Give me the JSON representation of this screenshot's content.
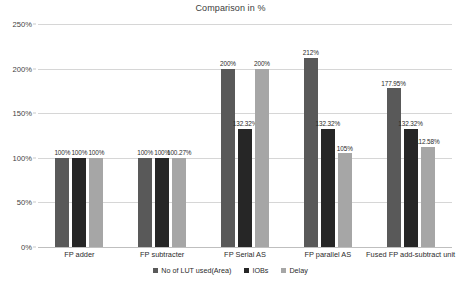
{
  "chart_data": {
    "type": "bar",
    "title": "Comparison in %",
    "xlabel": "",
    "ylabel": "",
    "ylim": [
      0,
      250
    ],
    "ytick_labels": [
      "0%",
      "50%",
      "100%",
      "150%",
      "200%",
      "250%"
    ],
    "ytick_values": [
      0,
      50,
      100,
      150,
      200,
      250
    ],
    "grid": true,
    "legend_position": "bottom",
    "categories": [
      "FP adder",
      "FP subtracter",
      "FP  Serial AS",
      "FP parallel AS",
      "Fused FP add-subtract unit"
    ],
    "series": [
      {
        "name": "No of LUT used(Area)",
        "color": "#595959",
        "values": [
          100,
          100,
          200,
          212,
          177.95
        ],
        "labels": [
          "100%",
          "100%",
          "200%",
          "212%",
          "177.95%"
        ]
      },
      {
        "name": "IOBs",
        "color": "#262626",
        "values": [
          100,
          100,
          132.32,
          132.32,
          132.32
        ],
        "labels": [
          "100%",
          "100%",
          "132.32%",
          "132.32%",
          "132.32%"
        ]
      },
      {
        "name": "Delay",
        "color": "#a6a6a6",
        "values": [
          100,
          100.27,
          200,
          105,
          112.58
        ],
        "labels": [
          "100%",
          "100.27%",
          "200%",
          "105%",
          "112.58%"
        ]
      }
    ]
  },
  "colors": {
    "background": "#ffffff",
    "gridline": "#d6d6d6",
    "axis_line": "#bfbfbf",
    "text": "#2b2b2b",
    "title_text": "#3b3b3b"
  }
}
